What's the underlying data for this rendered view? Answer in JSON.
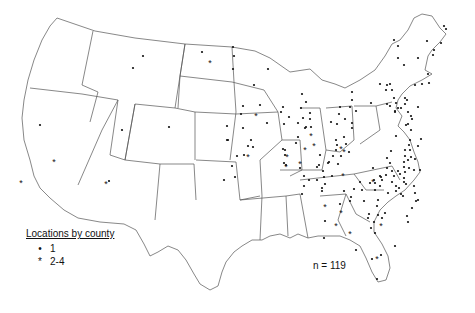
{
  "map": {
    "region": "Contiguous United States",
    "n_label": "n = 119",
    "legend": {
      "title": "Locations by county",
      "items": [
        {
          "symbol": "•",
          "label": "1"
        },
        {
          "symbol": "*",
          "label": "2-4"
        }
      ]
    },
    "single_points": [
      [
        143,
        56
      ],
      [
        133,
        68
      ],
      [
        202,
        52
      ],
      [
        234,
        56
      ],
      [
        233,
        69
      ],
      [
        40,
        125
      ],
      [
        122,
        130
      ],
      [
        244,
        155
      ],
      [
        237,
        156
      ],
      [
        232,
        166
      ],
      [
        235,
        177
      ],
      [
        109,
        181
      ],
      [
        169,
        127
      ],
      [
        227,
        126
      ],
      [
        224,
        180
      ],
      [
        233,
        47
      ],
      [
        268,
        69
      ],
      [
        254,
        85
      ],
      [
        302,
        94
      ],
      [
        306,
        102
      ],
      [
        301,
        108
      ],
      [
        310,
        113
      ],
      [
        303,
        118
      ],
      [
        311,
        127
      ],
      [
        241,
        114
      ],
      [
        267,
        123
      ],
      [
        243,
        128
      ],
      [
        227,
        140
      ],
      [
        228,
        140
      ],
      [
        260,
        105
      ],
      [
        243,
        106
      ],
      [
        283,
        107
      ],
      [
        281,
        112
      ],
      [
        289,
        117
      ],
      [
        298,
        123
      ],
      [
        284,
        124
      ],
      [
        298,
        137
      ],
      [
        296,
        143
      ],
      [
        283,
        149
      ],
      [
        285,
        155
      ],
      [
        286,
        165
      ],
      [
        285,
        150
      ],
      [
        306,
        127
      ],
      [
        253,
        147
      ],
      [
        284,
        163
      ],
      [
        310,
        119
      ],
      [
        251,
        140
      ],
      [
        248,
        146
      ],
      [
        305,
        128
      ],
      [
        337,
        124
      ],
      [
        352,
        100
      ],
      [
        339,
        114
      ],
      [
        345,
        119
      ],
      [
        352,
        123
      ],
      [
        331,
        122
      ],
      [
        350,
        107
      ],
      [
        340,
        107
      ],
      [
        356,
        111
      ],
      [
        344,
        137
      ],
      [
        346,
        144
      ],
      [
        349,
        152
      ],
      [
        333,
        156
      ],
      [
        341,
        156
      ],
      [
        320,
        155
      ],
      [
        317,
        167
      ],
      [
        324,
        177
      ],
      [
        328,
        163
      ],
      [
        325,
        184
      ],
      [
        322,
        191
      ],
      [
        329,
        162
      ],
      [
        319,
        165
      ],
      [
        304,
        176
      ],
      [
        300,
        168
      ],
      [
        323,
        171
      ],
      [
        322,
        188
      ],
      [
        332,
        176
      ],
      [
        352,
        128
      ],
      [
        336,
        140
      ],
      [
        337,
        145
      ],
      [
        336,
        150
      ],
      [
        338,
        164
      ],
      [
        394,
        98
      ],
      [
        371,
        103
      ],
      [
        406,
        125
      ],
      [
        373,
        168
      ],
      [
        381,
        177
      ],
      [
        392,
        171
      ],
      [
        398,
        171
      ],
      [
        405,
        172
      ],
      [
        400,
        174
      ],
      [
        392,
        182
      ],
      [
        406,
        184
      ],
      [
        401,
        194
      ],
      [
        414,
        186
      ],
      [
        304,
        186
      ],
      [
        302,
        194
      ],
      [
        396,
        136
      ],
      [
        387,
        158
      ],
      [
        390,
        163
      ],
      [
        309,
        180
      ],
      [
        317,
        180
      ],
      [
        344,
        191
      ],
      [
        351,
        197
      ],
      [
        378,
        200
      ],
      [
        388,
        193
      ],
      [
        404,
        182
      ],
      [
        403,
        196
      ],
      [
        377,
        206
      ],
      [
        382,
        218
      ],
      [
        375,
        233
      ],
      [
        325,
        221
      ],
      [
        324,
        238
      ],
      [
        350,
        201
      ],
      [
        340,
        204
      ],
      [
        369,
        214
      ],
      [
        374,
        222
      ],
      [
        368,
        218
      ],
      [
        371,
        228
      ],
      [
        372,
        259
      ],
      [
        394,
        40
      ],
      [
        398,
        46
      ],
      [
        398,
        58
      ],
      [
        404,
        65
      ],
      [
        387,
        85
      ],
      [
        418,
        58
      ],
      [
        427,
        41
      ],
      [
        434,
        50
      ],
      [
        433,
        55
      ],
      [
        444,
        26
      ],
      [
        446,
        29
      ],
      [
        441,
        43
      ],
      [
        428,
        74
      ],
      [
        422,
        84
      ],
      [
        390,
        84
      ],
      [
        380,
        84
      ],
      [
        352,
        92
      ],
      [
        415,
        85
      ],
      [
        395,
        112
      ],
      [
        429,
        83
      ],
      [
        387,
        104
      ],
      [
        404,
        167
      ],
      [
        404,
        178
      ],
      [
        396,
        186
      ],
      [
        399,
        188
      ],
      [
        396,
        191
      ],
      [
        382,
        180
      ],
      [
        380,
        176
      ],
      [
        374,
        180
      ],
      [
        401,
        108
      ],
      [
        395,
        111
      ],
      [
        405,
        150
      ],
      [
        391,
        151
      ],
      [
        405,
        156
      ],
      [
        409,
        145
      ],
      [
        404,
        162
      ],
      [
        394,
        176
      ],
      [
        387,
        168
      ],
      [
        386,
        175
      ],
      [
        364,
        201
      ],
      [
        375,
        190
      ],
      [
        405,
        98
      ],
      [
        386,
        90
      ],
      [
        392,
        90
      ],
      [
        390,
        106
      ],
      [
        396,
        103
      ],
      [
        398,
        108
      ],
      [
        405,
        104
      ],
      [
        407,
        100
      ],
      [
        408,
        112
      ],
      [
        411,
        116
      ],
      [
        412,
        119
      ],
      [
        418,
        107
      ],
      [
        408,
        124
      ],
      [
        411,
        130
      ],
      [
        360,
        182
      ],
      [
        354,
        189
      ],
      [
        362,
        190
      ],
      [
        370,
        183
      ],
      [
        375,
        183
      ],
      [
        380,
        186
      ],
      [
        412,
        208
      ],
      [
        416,
        201
      ],
      [
        418,
        200
      ],
      [
        415,
        193
      ],
      [
        407,
        216
      ],
      [
        408,
        222
      ],
      [
        395,
        246
      ],
      [
        381,
        255
      ],
      [
        356,
        250
      ],
      [
        377,
        279
      ],
      [
        385,
        213
      ],
      [
        378,
        215
      ],
      [
        414,
        170
      ],
      [
        418,
        146
      ],
      [
        421,
        139
      ],
      [
        410,
        140
      ],
      [
        410,
        150
      ],
      [
        408,
        160
      ],
      [
        411,
        157
      ],
      [
        415,
        159
      ],
      [
        420,
        170
      ],
      [
        409,
        168
      ]
    ],
    "multi_points": [
      [
        210,
        63
      ],
      [
        21,
        183
      ],
      [
        54,
        162
      ],
      [
        106,
        184
      ],
      [
        344,
        152
      ],
      [
        343,
        176
      ],
      [
        256,
        116
      ],
      [
        287,
        157
      ],
      [
        286,
        167
      ],
      [
        305,
        150
      ],
      [
        300,
        164
      ],
      [
        248,
        157
      ],
      [
        341,
        149
      ],
      [
        311,
        136
      ],
      [
        314,
        146
      ],
      [
        325,
        207
      ],
      [
        341,
        213
      ],
      [
        336,
        226
      ],
      [
        373,
        182
      ],
      [
        381,
        226
      ],
      [
        350,
        234
      ],
      [
        377,
        259
      ]
    ]
  }
}
